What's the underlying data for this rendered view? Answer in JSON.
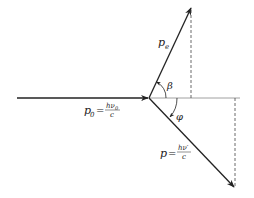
{
  "diagram": {
    "colors": {
      "line": "#222222",
      "dashed": "#444444",
      "axis": "#888888",
      "background": "#ffffff"
    },
    "origin": {
      "x": 149,
      "y": 98
    },
    "vectors": [
      {
        "id": "incident",
        "label": "p",
        "subscript": "0",
        "equation": "= hν₀ / c",
        "from": [
          17,
          98
        ],
        "to": [
          149,
          98
        ]
      },
      {
        "id": "electron",
        "label": "p",
        "subscript": "e",
        "from": [
          149,
          98
        ],
        "to": [
          191,
          8
        ]
      },
      {
        "id": "scattered",
        "label": "p",
        "equation": "= hν′ / c",
        "from": [
          149,
          98
        ],
        "to": [
          234,
          187
        ]
      }
    ],
    "angles": [
      {
        "id": "beta",
        "symbol": "β",
        "between": [
          "axis",
          "electron"
        ]
      },
      {
        "id": "phi",
        "symbol": "φ",
        "between": [
          "axis",
          "scattered"
        ]
      }
    ],
    "labels": {
      "p0_main": "p",
      "p0_sub": "0",
      "p0_eq": "=",
      "p0_num": "hν",
      "p0_num_sub": "0",
      "p0_den": "c",
      "pe_main": "p",
      "pe_sub": "e",
      "p_main": "p",
      "p_eq": "=",
      "p_num": "hν′",
      "p_den": "c",
      "beta": "β",
      "phi": "φ"
    }
  }
}
